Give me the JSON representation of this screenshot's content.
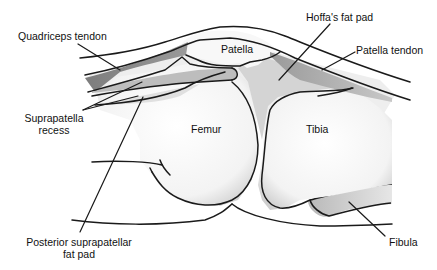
{
  "diagram": {
    "labels": {
      "quadriceps_tendon": "Quadriceps tendon",
      "suprapatella_recess_line1": "Suprapatella",
      "suprapatella_recess_line2": "recess",
      "posterior_fat_pad_line1": "Posterior suprapatellar",
      "posterior_fat_pad_line2": "fat pad",
      "patella": "Patella",
      "hoffas_fat_pad": "Hoffa's fat pad",
      "patella_tendon": "Patella tendon",
      "femur": "Femur",
      "tibia": "Tibia",
      "fibula": "Fibula"
    },
    "colors": {
      "outline": "#1a1a1a",
      "tendon_fill": "#8c8c8c",
      "fat_pad_fill": "#d4d4d4",
      "recess_fill": "#bdbdbd",
      "bone_fill": "#f7f7f7",
      "background": "#ffffff"
    }
  }
}
